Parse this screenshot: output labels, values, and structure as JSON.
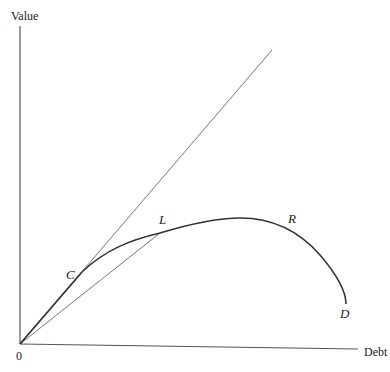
{
  "diagram": {
    "y_axis_label": "Value",
    "x_axis_label": "Debt",
    "origin_label": "0",
    "points": {
      "C": "C",
      "L": "L",
      "R": "R",
      "D": "D"
    },
    "colors": {
      "axis": "#555555",
      "curve": "#333333",
      "thin_line": "#666666"
    }
  }
}
